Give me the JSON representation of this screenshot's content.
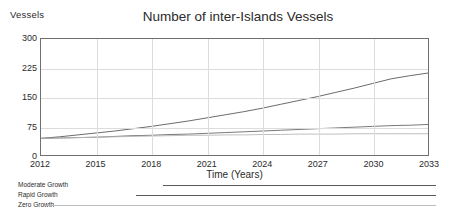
{
  "chart_data": {
    "type": "line",
    "title": "Number of inter-Islands Vessels",
    "xlabel": "Time (Years)",
    "ylabel": "Vessels",
    "grid": true,
    "legend_position": "below-left",
    "xlim": [
      2012,
      2033
    ],
    "ylim": [
      0,
      300
    ],
    "x_ticks": [
      "2012",
      "2015",
      "2018",
      "2021",
      "2024",
      "2027",
      "2030",
      "2033"
    ],
    "y_ticks": [
      "0",
      "75",
      "150",
      "225",
      "300"
    ],
    "x": [
      2012,
      2013,
      2014,
      2015,
      2016,
      2017,
      2018,
      2019,
      2020,
      2021,
      2022,
      2023,
      2024,
      2025,
      2026,
      2027,
      2028,
      2029,
      2030,
      2031,
      2032,
      2033
    ],
    "series": [
      {
        "name": "Rapid Growth",
        "color": "#5a5a5a",
        "values": [
          43,
          47,
          52,
          57,
          62,
          68,
          74,
          81,
          88,
          96,
          104,
          112,
          121,
          131,
          141,
          151,
          162,
          173,
          185,
          197,
          205,
          212
        ]
      },
      {
        "name": "Moderate Growth",
        "color": "#6a6a6a",
        "values": [
          43,
          44,
          45,
          46,
          48,
          50,
          51,
          53,
          54,
          56,
          58,
          60,
          62,
          64,
          66,
          68,
          70,
          72,
          74,
          76,
          77,
          79
        ]
      },
      {
        "name": "Zero Growth",
        "color": "#b8b8b8",
        "values": [
          43,
          44,
          45,
          46,
          47,
          48,
          49,
          50,
          51,
          51,
          52,
          52,
          53,
          53,
          54,
          54,
          54,
          55,
          55,
          55,
          55,
          55
        ]
      }
    ]
  },
  "legend": {
    "entries": [
      {
        "label": "Moderate Growth",
        "color": "#5a5a5a",
        "line_start_pct": 36,
        "line_end_pct": 96
      },
      {
        "label": "Rapid Growth",
        "color": "#5a5a5a",
        "line_start_pct": 30,
        "line_end_pct": 96
      },
      {
        "label": "Zero Growth",
        "color": "#bdbdbd",
        "line_start_pct": 10,
        "line_end_pct": 96
      }
    ]
  },
  "colors": {
    "axis": "#6f6f6f",
    "grid": "#dcdcdc",
    "text": "#2b2b2b",
    "background": "#ffffff"
  }
}
